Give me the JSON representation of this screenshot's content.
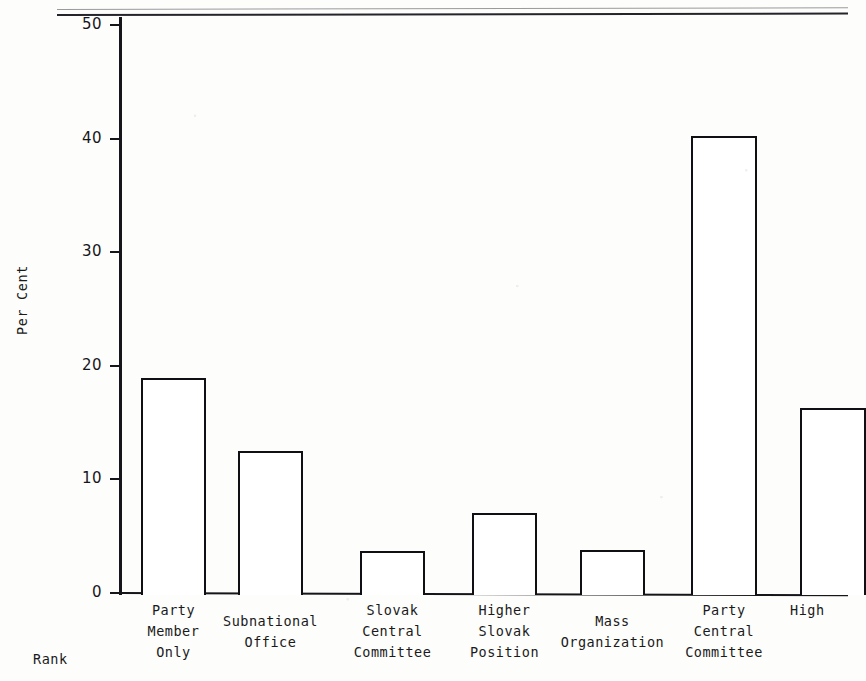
{
  "chart_data": {
    "type": "bar",
    "title": "",
    "xlabel": "Rank",
    "ylabel": "Per Cent",
    "ylim": [
      0,
      50
    ],
    "ytick_labels": [
      "0",
      "10",
      "20",
      "30",
      "40",
      "50"
    ],
    "yticks": [
      0,
      10,
      20,
      30,
      40,
      50
    ],
    "grid": false,
    "legend": null,
    "categories": [
      "Party\nMember\nOnly",
      "Subnational\nOffice",
      "Slovak\nCentral\nCommittee",
      "Higher\nSlovak\nPosition",
      "Mass\nOrganization",
      "Party\nCentral\nCommittee",
      "High"
    ],
    "values": [
      18.9,
      12.5,
      3.7,
      7.0,
      3.8,
      40.2,
      16.3
    ]
  },
  "axis": {
    "y_title": "Per Cent",
    "x_title": "Rank"
  },
  "colors": {
    "ink": "#16161a",
    "bar_stroke": "#101014",
    "bar_fill": "#ffffff",
    "page": "#fdfdfc",
    "rule": "#9a9a9a"
  }
}
